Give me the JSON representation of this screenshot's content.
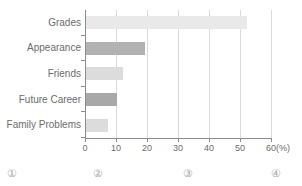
{
  "chart_data": {
    "type": "bar",
    "orientation": "horizontal",
    "title": "",
    "xlabel": "(%)",
    "ylabel": "",
    "categories": [
      "Grades",
      "Appearance",
      "Friends",
      "Future Career",
      "Family Problems"
    ],
    "values": [
      52,
      19,
      12,
      10,
      7
    ],
    "series": [
      {
        "name": "Percentage",
        "values": [
          52,
          19,
          12,
          10,
          7
        ]
      }
    ],
    "bar_colors": [
      "#e9e9e9",
      "#b2b2b2",
      "#dcdcdc",
      "#a8a8a8",
      "#dcdcdc"
    ],
    "xlim": [
      0,
      60
    ],
    "xticks": [
      0,
      10,
      20,
      30,
      40,
      50,
      60
    ],
    "xtick_labels": [
      "0",
      "10",
      "20",
      "30",
      "40",
      "50",
      "60"
    ],
    "grid": true,
    "grid_axis": "x",
    "legend": false
  },
  "axis": {
    "unit_label": "(%)"
  },
  "footer": {
    "options": [
      {
        "label": "①",
        "x": 12
      },
      {
        "label": "②",
        "x": 98
      },
      {
        "label": "③",
        "x": 188
      },
      {
        "label": "④",
        "x": 276
      }
    ]
  },
  "colors": {
    "axis": "#8c8c8c",
    "grid": "#d9d9d9",
    "text": "#6b6b6b",
    "marker": "#a6a6a6"
  }
}
